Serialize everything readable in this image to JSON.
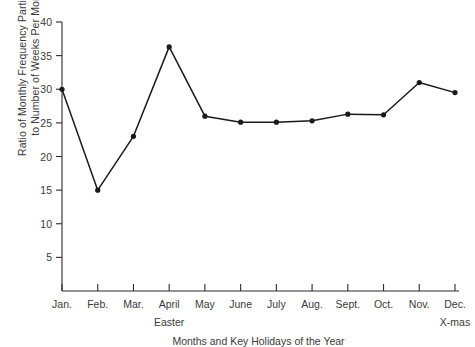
{
  "chart_data": {
    "type": "line",
    "title": "",
    "xlabel": "Months and Key Holidays of the Year",
    "ylabel": "Ratio of Monthly Frequency Participants to Number of Weeks Per Month",
    "ylabel_line1": "Ratio of Monthly Frequency Participants",
    "ylabel_line2": "to Number of Weeks Per Month",
    "categories": [
      "Jan.",
      "Feb.",
      "Mar.",
      "April",
      "May",
      "June",
      "July",
      "Aug.",
      "Sept.",
      "Oct.",
      "Nov.",
      "Dec."
    ],
    "values": [
      30,
      15,
      23,
      36.3,
      26,
      25.1,
      25.1,
      25.3,
      26.3,
      26.2,
      31,
      29.5
    ],
    "ylim": [
      0,
      40
    ],
    "ytick_values": [
      5,
      10,
      15,
      20,
      25,
      30,
      35,
      40
    ],
    "ytick_labels": [
      "5",
      "10",
      "15",
      "20",
      "25",
      "30",
      "35",
      "40"
    ],
    "grid": false,
    "legend": false,
    "legend_position": "none",
    "line_color": "#1a1a1a",
    "marker": "circle",
    "marker_color": "#1a1a1a",
    "annotations": [
      {
        "label": "Easter",
        "category": "April"
      },
      {
        "label": "X-mas",
        "category": "Dec."
      }
    ]
  }
}
